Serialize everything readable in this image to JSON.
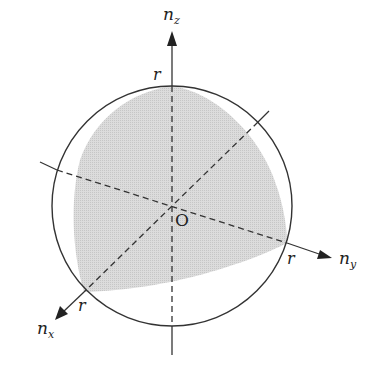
{
  "diagram": {
    "type": "3D coordinate sketch with circle and shaded spherical-triangle region",
    "colors": {
      "line": "#333333",
      "shade": "#d2d2d2",
      "background": "#ffffff"
    },
    "origin": {
      "label": "O",
      "x": 172,
      "y": 206
    },
    "circle": {
      "cx": 172,
      "cy": 206,
      "r": 120
    },
    "axes": [
      {
        "id": "z",
        "label_main": "n",
        "label_sub": "z",
        "radius_label": "r"
      },
      {
        "id": "y",
        "label_main": "n",
        "label_sub": "y",
        "radius_label": "r"
      },
      {
        "id": "x",
        "label_main": "n",
        "label_sub": "x",
        "radius_label": "r"
      }
    ]
  }
}
